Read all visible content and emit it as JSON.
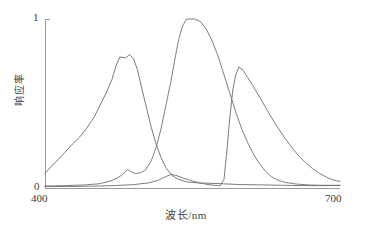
{
  "chart_data": {
    "type": "line",
    "title": "",
    "xlabel": "波长/nm",
    "ylabel": "响应率",
    "xlim": [
      400,
      700
    ],
    "ylim": [
      0,
      1
    ],
    "xticks": [
      "400",
      "700"
    ],
    "yticks": [
      "0",
      "1"
    ],
    "grid": false,
    "legend": "none",
    "series": [
      {
        "name": "blue-channel-response",
        "color": "#6b6b6b",
        "peak_x": 474,
        "peak_y": 0.77,
        "points": [
          [
            400,
            0.085
          ],
          [
            405,
            0.12
          ],
          [
            412,
            0.16
          ],
          [
            420,
            0.21
          ],
          [
            428,
            0.26
          ],
          [
            435,
            0.3
          ],
          [
            442,
            0.35
          ],
          [
            450,
            0.42
          ],
          [
            456,
            0.49
          ],
          [
            462,
            0.56
          ],
          [
            468,
            0.64
          ],
          [
            472,
            0.72
          ],
          [
            476,
            0.775
          ],
          [
            482,
            0.77
          ],
          [
            486,
            0.79
          ],
          [
            490,
            0.765
          ],
          [
            494,
            0.7
          ],
          [
            498,
            0.6
          ],
          [
            503,
            0.48
          ],
          [
            508,
            0.36
          ],
          [
            513,
            0.26
          ],
          [
            518,
            0.18
          ],
          [
            523,
            0.12
          ],
          [
            529,
            0.075
          ],
          [
            536,
            0.05
          ],
          [
            545,
            0.035
          ],
          [
            556,
            0.03
          ],
          [
            568,
            0.028
          ],
          [
            580,
            0.025
          ],
          [
            600,
            0.02
          ],
          [
            625,
            0.018
          ],
          [
            650,
            0.015
          ],
          [
            675,
            0.014
          ],
          [
            700,
            0.015
          ]
        ]
      },
      {
        "name": "green-channel-response",
        "color": "#707070",
        "peak_x": 540,
        "peak_y": 1.0,
        "points": [
          [
            400,
            0.012
          ],
          [
            420,
            0.014
          ],
          [
            440,
            0.018
          ],
          [
            455,
            0.025
          ],
          [
            466,
            0.04
          ],
          [
            474,
            0.06
          ],
          [
            480,
            0.085
          ],
          [
            484,
            0.11
          ],
          [
            488,
            0.095
          ],
          [
            492,
            0.085
          ],
          [
            497,
            0.09
          ],
          [
            502,
            0.105
          ],
          [
            508,
            0.16
          ],
          [
            513,
            0.24
          ],
          [
            518,
            0.35
          ],
          [
            523,
            0.49
          ],
          [
            528,
            0.63
          ],
          [
            532,
            0.76
          ],
          [
            536,
            0.88
          ],
          [
            540,
            0.96
          ],
          [
            544,
            1.0
          ],
          [
            552,
            1.0
          ],
          [
            558,
            0.985
          ],
          [
            564,
            0.94
          ],
          [
            570,
            0.87
          ],
          [
            576,
            0.78
          ],
          [
            582,
            0.67
          ],
          [
            588,
            0.56
          ],
          [
            594,
            0.45
          ],
          [
            600,
            0.35
          ],
          [
            606,
            0.27
          ],
          [
            612,
            0.2
          ],
          [
            618,
            0.145
          ],
          [
            624,
            0.1
          ],
          [
            630,
            0.068
          ],
          [
            637,
            0.046
          ],
          [
            645,
            0.032
          ],
          [
            655,
            0.024
          ],
          [
            668,
            0.018
          ],
          [
            682,
            0.016
          ],
          [
            700,
            0.016
          ]
        ]
      },
      {
        "name": "red-channel-response",
        "color": "#6e6e6e",
        "peak_x": 598,
        "peak_y": 0.715,
        "points": [
          [
            400,
            0.008
          ],
          [
            440,
            0.01
          ],
          [
            470,
            0.014
          ],
          [
            490,
            0.02
          ],
          [
            505,
            0.03
          ],
          [
            515,
            0.045
          ],
          [
            522,
            0.065
          ],
          [
            528,
            0.08
          ],
          [
            533,
            0.075
          ],
          [
            540,
            0.06
          ],
          [
            548,
            0.045
          ],
          [
            556,
            0.032
          ],
          [
            564,
            0.022
          ],
          [
            572,
            0.016
          ],
          [
            578,
            0.013
          ],
          [
            582,
            0.05
          ],
          [
            585,
            0.22
          ],
          [
            588,
            0.42
          ],
          [
            591,
            0.58
          ],
          [
            594,
            0.67
          ],
          [
            597,
            0.715
          ],
          [
            601,
            0.7
          ],
          [
            606,
            0.655
          ],
          [
            612,
            0.6
          ],
          [
            618,
            0.54
          ],
          [
            624,
            0.48
          ],
          [
            630,
            0.42
          ],
          [
            637,
            0.355
          ],
          [
            644,
            0.295
          ],
          [
            651,
            0.24
          ],
          [
            658,
            0.19
          ],
          [
            665,
            0.15
          ],
          [
            672,
            0.115
          ],
          [
            679,
            0.087
          ],
          [
            686,
            0.065
          ],
          [
            692,
            0.05
          ],
          [
            697,
            0.042
          ],
          [
            700,
            0.04
          ]
        ]
      }
    ]
  },
  "axes": {
    "y_top_label": "1",
    "y_zero_label": "0",
    "x_min_label": "400",
    "x_max_label": "700",
    "x_axis_title": "波长/nm",
    "y_axis_title": "响应率"
  },
  "colors": {
    "axis": "#9a9a9a",
    "text": "#3f3f3f",
    "background": "#ffffff"
  },
  "geometry": {
    "plot_left": 45,
    "plot_right": 340,
    "plot_top": 19,
    "plot_bottom": 188
  }
}
